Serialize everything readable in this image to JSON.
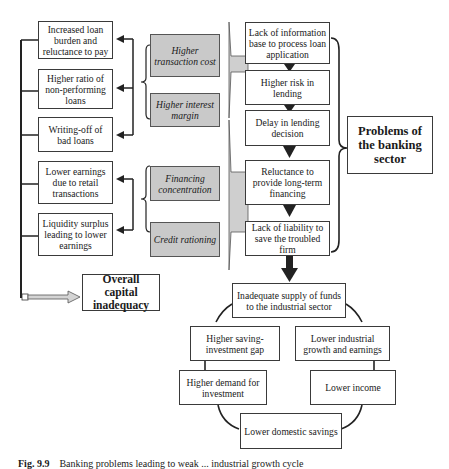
{
  "left_effects": [
    {
      "id": "loan-burden",
      "text": "Increased loan burden and reluctance to pay"
    },
    {
      "id": "npl-ratio",
      "text": "Higher ratio of non-performing loans"
    },
    {
      "id": "bad-loans",
      "text": "Writing-off of bad loans"
    },
    {
      "id": "lower-earnings",
      "text": "Lower earnings due to retail transactions"
    },
    {
      "id": "liquidity-surplus",
      "text": "Liquidity surplus leading to lower earnings"
    }
  ],
  "middle_factors": [
    {
      "id": "transaction-cost",
      "text": "Higher transaction cost"
    },
    {
      "id": "interest-margin",
      "text": "Higher interest margin"
    },
    {
      "id": "financing-concentration",
      "text": "Financing concentration"
    },
    {
      "id": "credit-rationing",
      "text": "Credit rationing"
    }
  ],
  "problem_chain": [
    {
      "id": "lack-info",
      "text": "Lack of information base to process loan application"
    },
    {
      "id": "higher-risk",
      "text": "Higher risk in lending"
    },
    {
      "id": "delay",
      "text": "Delay in lending decision"
    },
    {
      "id": "reluctance",
      "text": "Reluctance to provide long-term financing"
    },
    {
      "id": "lack-liability",
      "text": "Lack of liability to save the troubled firm"
    }
  ],
  "problems_label": "Problems of the banking sector",
  "capital_inadequacy": "Overall capital inadequacy",
  "cycle": {
    "top": "Inadequate supply of funds to the industrial sector",
    "saving_gap": "Higher saving-investment gap",
    "industrial_growth": "Lower industrial growth and earnings",
    "demand_investment": "Higher demand for investment",
    "lower_income": "Lower income",
    "domestic_savings": "Lower domestic savings"
  },
  "caption": {
    "label": "Fig. 9.9",
    "text": "Banking problems leading to weak ... industrial growth cycle"
  }
}
